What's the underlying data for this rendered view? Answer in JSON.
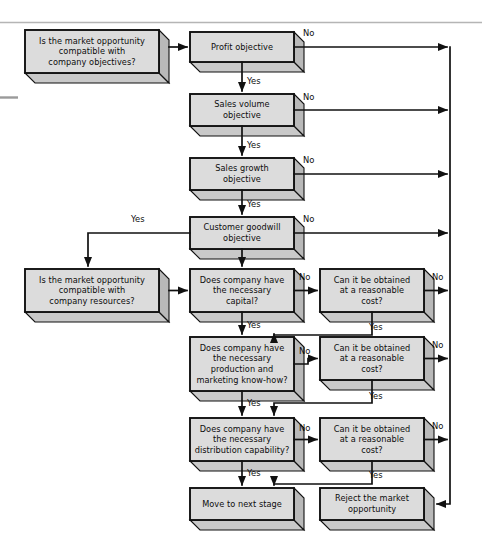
{
  "figure": {
    "type": "flowchart",
    "background_color": "#ffffff",
    "node_fill_color": "#dcdcdc",
    "node_side_color": "#b9b9b9",
    "node_shadow_color": "#c9c9c9",
    "stroke_color": "#111111",
    "rule_color": "#b5b5b5"
  },
  "nodes": [
    {
      "id": "objectives",
      "text": "Is the market opportunity\ncompatible with\ncompany objectives?",
      "x": 25,
      "y": 30,
      "w": 134,
      "h": 43
    },
    {
      "id": "profit",
      "text": "Profit objective",
      "x": 190,
      "y": 32,
      "w": 104,
      "h": 30
    },
    {
      "id": "salesvol",
      "text": "Sales volume\nobjective",
      "x": 190,
      "y": 94,
      "w": 104,
      "h": 32
    },
    {
      "id": "salesgrowth",
      "text": "Sales growth\nobjective",
      "x": 190,
      "y": 158,
      "w": 104,
      "h": 32
    },
    {
      "id": "goodwill",
      "text": "Customer goodwill\nobjective",
      "x": 190,
      "y": 217,
      "w": 104,
      "h": 32
    },
    {
      "id": "resources",
      "text": "Is the market opportunity\ncompatible with\ncompany resources?",
      "x": 25,
      "y": 269,
      "w": 134,
      "h": 43
    },
    {
      "id": "capital",
      "text": "Does company have\nthe necessary\ncapital?",
      "x": 190,
      "y": 269,
      "w": 104,
      "h": 43
    },
    {
      "id": "cost1",
      "text": "Can it be obtained\nat a reasonable\ncost?",
      "x": 320,
      "y": 269,
      "w": 104,
      "h": 43
    },
    {
      "id": "production",
      "text": "Does company have\nthe necessary\nproduction and\nmarketing know-how?",
      "x": 190,
      "y": 337,
      "w": 104,
      "h": 54
    },
    {
      "id": "cost2",
      "text": "Can it be obtained\nat a reasonable\ncost?",
      "x": 320,
      "y": 337,
      "w": 104,
      "h": 43
    },
    {
      "id": "distribution",
      "text": "Does company have\nthe necessary\ndistribution capability?",
      "x": 190,
      "y": 418,
      "w": 104,
      "h": 43
    },
    {
      "id": "cost3",
      "text": "Can it be obtained\nat a reasonable\ncost?",
      "x": 320,
      "y": 418,
      "w": 104,
      "h": 43
    },
    {
      "id": "nextstage",
      "text": "Move to next stage",
      "x": 190,
      "y": 488,
      "w": 104,
      "h": 32
    },
    {
      "id": "reject",
      "text": "Reject the market\nopportunity",
      "x": 320,
      "y": 488,
      "w": 104,
      "h": 32
    }
  ],
  "edge_labels": [
    {
      "id": "no-profit",
      "text": "No",
      "x": 303,
      "y": 28
    },
    {
      "id": "yes-profit",
      "text": "Yes",
      "x": 247,
      "y": 76
    },
    {
      "id": "no-salesvol",
      "text": "No",
      "x": 303,
      "y": 92
    },
    {
      "id": "yes-salesvol",
      "text": "Yes",
      "x": 247,
      "y": 140
    },
    {
      "id": "no-salesgrowth",
      "text": "No",
      "x": 303,
      "y": 155
    },
    {
      "id": "yes-salesgrowth",
      "text": "Yes",
      "x": 247,
      "y": 199
    },
    {
      "id": "no-goodwill",
      "text": "No",
      "x": 303,
      "y": 214
    },
    {
      "id": "yes-goodwill",
      "text": "Yes",
      "x": 131,
      "y": 214
    },
    {
      "id": "no-capital",
      "text": "No",
      "x": 299,
      "y": 272
    },
    {
      "id": "no-cost1",
      "text": "No",
      "x": 432,
      "y": 272
    },
    {
      "id": "yes-capital",
      "text": "Yes",
      "x": 247,
      "y": 320
    },
    {
      "id": "yes-cost1",
      "text": "Yes",
      "x": 369,
      "y": 322
    },
    {
      "id": "no-production",
      "text": "No",
      "x": 299,
      "y": 346
    },
    {
      "id": "no-cost2",
      "text": "No",
      "x": 432,
      "y": 340
    },
    {
      "id": "yes-production",
      "text": "Yes",
      "x": 247,
      "y": 398
    },
    {
      "id": "yes-cost2",
      "text": "Yes",
      "x": 369,
      "y": 391
    },
    {
      "id": "no-distribution",
      "text": "No",
      "x": 299,
      "y": 423
    },
    {
      "id": "no-cost3",
      "text": "No",
      "x": 432,
      "y": 421
    },
    {
      "id": "yes-distribution",
      "text": "Yes",
      "x": 247,
      "y": 468
    },
    {
      "id": "yes-cost3",
      "text": "Yes",
      "x": 369,
      "y": 470
    }
  ]
}
